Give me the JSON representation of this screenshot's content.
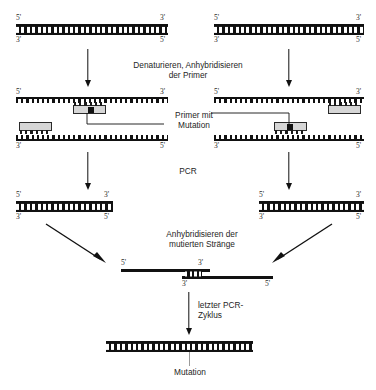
{
  "figure": {
    "language": "de",
    "colors": {
      "dna_dark": "#111111",
      "primer_fill": "#d6d6d6",
      "mutation_marker": "#111111",
      "background": "#ffffff",
      "text": "#252525"
    }
  },
  "labels": {
    "five_prime": "5'",
    "three_prime": "3'"
  },
  "steps": [
    {
      "id": "step-denature",
      "text_line1": "Denaturieren, Anhybridisieren",
      "text_line2": "der Primer"
    },
    {
      "id": "step-pcr",
      "text_line1": "PCR",
      "text_line2": ""
    },
    {
      "id": "step-anneal-mutant",
      "text_line1": "Anhybridisieren der",
      "text_line2": "mutierten Stränge"
    },
    {
      "id": "step-last-cycle",
      "text_line1": "letzter PCR-",
      "text_line2": "Zyklus"
    }
  ],
  "callouts": {
    "primer_mutation_line1": "Primer mit",
    "primer_mutation_line2": "Mutation",
    "mutation_bottom": "Mutation"
  },
  "stages": {
    "top_duplex_left": {
      "name": "Ausgangs-DNA-Doppelstrang links",
      "top_left_end": "5'",
      "top_right_end": "3'",
      "bottom_left_end": "3'",
      "bottom_right_end": "5'"
    },
    "top_duplex_right": {
      "name": "Ausgangs-DNA-Doppelstrang rechts",
      "top_left_end": "5'",
      "top_right_end": "3'",
      "bottom_left_end": "3'",
      "bottom_right_end": "5'"
    },
    "primed_left": {
      "name": "Denaturierte Stränge mit Primern links",
      "top_left_end": "5'",
      "top_right_end": "3'",
      "bottom_left_end": "3'",
      "bottom_right_end": "5'",
      "mutation_primer_position": "top-strand-center",
      "plain_primer_position": "bottom-strand-left"
    },
    "primed_right": {
      "name": "Denaturierte Stränge mit Primern rechts",
      "top_left_end": "5'",
      "top_right_end": "3'",
      "bottom_left_end": "3'",
      "bottom_right_end": "5'",
      "mutation_primer_position": "bottom-strand-center",
      "plain_primer_position": "top-strand-right"
    },
    "pcr_product_left": {
      "name": "PCR-Produkt links",
      "top_left_end": "5'",
      "top_right_end": "3'",
      "bottom_left_end": "3'",
      "bottom_right_end": "5'"
    },
    "pcr_product_right": {
      "name": "PCR-Produkt rechts",
      "top_left_end": "5'",
      "top_right_end": "3'",
      "bottom_left_end": "3'",
      "bottom_right_end": "5'"
    },
    "heteroduplex": {
      "name": "Anhybridisierte mutierte Stränge",
      "upper_left_end": "5'",
      "upper_right_end": "3'",
      "lower_left_end": "3'",
      "lower_right_end": "5'"
    },
    "final_product": {
      "name": "Mutiertes Endprodukt",
      "mutation_label": "Mutation"
    }
  },
  "icons": {
    "arrow_down": "arrow-down-icon",
    "arrow_diagonal_right": "arrow-diagonal-down-right-icon",
    "arrow_diagonal_left": "arrow-diagonal-down-left-icon"
  }
}
